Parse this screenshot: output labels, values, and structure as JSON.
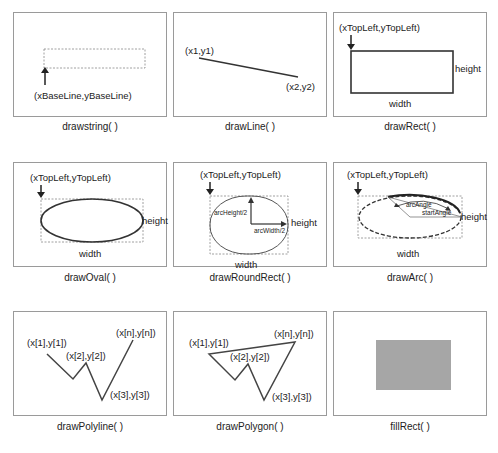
{
  "panels": [
    {
      "id": "drawstring",
      "caption": "drawstring( )",
      "labels": {
        "point": "(xBaseLine,yBaseLine)"
      }
    },
    {
      "id": "drawline",
      "caption": "drawLine( )",
      "labels": {
        "p1": "(x1,y1)",
        "p2": "(x2,y2)"
      }
    },
    {
      "id": "drawrect",
      "caption": "drawRect( )",
      "labels": {
        "origin": "(xTopLeft,yTopLeft)",
        "height": "height",
        "width": "width"
      }
    },
    {
      "id": "drawoval",
      "caption": "drawOval( )",
      "labels": {
        "origin": "(xTopLeft,yTopLeft)",
        "height": "height",
        "width": "width"
      }
    },
    {
      "id": "drawroundrect",
      "caption": "drawRoundRect( )",
      "labels": {
        "origin": "(xTopLeft,yTopLeft)",
        "arc_height": "arcHeight/2",
        "arc_width": "arcWidth/2",
        "height": "height",
        "width": "width"
      }
    },
    {
      "id": "drawarc",
      "caption": "drawArc( )",
      "labels": {
        "origin": "(xTopLeft,yTopLeft)",
        "arc_angle": "arcAngle",
        "start_angle": "startAngle",
        "height": "height",
        "width": "width"
      }
    },
    {
      "id": "drawpolyline",
      "caption": "drawPolyline( )",
      "labels": {
        "p1": "(x[1],y[1])",
        "p2": "(x[2],y[2])",
        "p3": "(x[3],y[3])",
        "pn": "(x[n],y[n])"
      }
    },
    {
      "id": "drawpolygon",
      "caption": "drawPolygon( )",
      "labels": {
        "p1": "(x[1],y[1])",
        "p2": "(x[2],y[2])",
        "p3": "(x[3],y[3])",
        "pn": "(x[n],y[n])"
      }
    },
    {
      "id": "fillrect",
      "caption": "fillRect( )",
      "fill_color": "#a6a6a6"
    }
  ],
  "colors": {
    "frame": "#9a9a9a",
    "stroke": "#333333",
    "dashed": "#888888",
    "fill": "#a6a6a6"
  }
}
